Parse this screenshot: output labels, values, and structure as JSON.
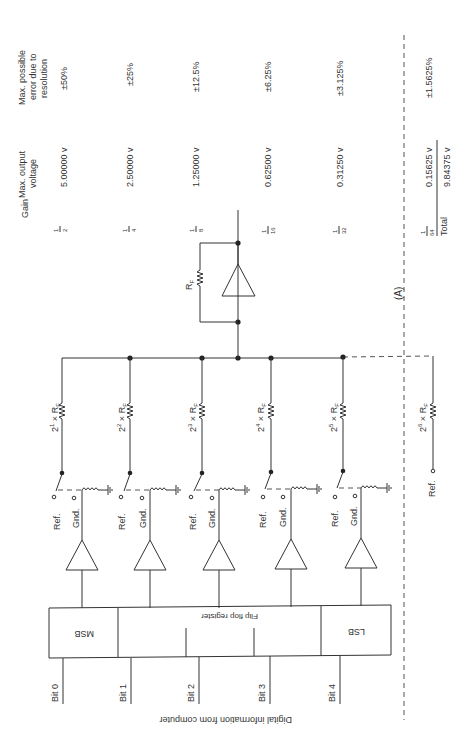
{
  "figure": {
    "label": "(A)",
    "caption_input": "Digital information from computer",
    "register": {
      "title": "Flip flop register",
      "msb": "MSB",
      "lsb": "LSB"
    },
    "bits": [
      "Bit 0",
      "Bit 1",
      "Bit 2",
      "Bit 3",
      "Bit 4"
    ],
    "switch_labels": {
      "ref": "Ref.",
      "gnd": "Gnd."
    },
    "resistors": [
      "2¹ × Rₙ",
      "2² × R",
      "2³ × R",
      "2⁴ × R",
      "2⁵ × R",
      "2⁶ × R"
    ],
    "resistor_base": [
      "2",
      "2",
      "2",
      "2",
      "2",
      "2"
    ],
    "resistor_exp": [
      "1",
      "2",
      "3",
      "4",
      "5",
      "6"
    ],
    "resistor_suffix": "× R",
    "resistor_sub": "F",
    "feedback_resistor": "R",
    "feedback_sub": "F",
    "extra_ref": "Ref."
  },
  "table": {
    "headers": {
      "gain": "Gain",
      "voltage_l1": "Max. output",
      "voltage_l2": "voltage",
      "error_l1": "Max. possible",
      "error_l2": "error due to",
      "error_l3": "resolution"
    },
    "rows": [
      {
        "gain_num": "1",
        "gain_den": "2",
        "voltage": "5.00000 v",
        "error": "±50%"
      },
      {
        "gain_num": "1",
        "gain_den": "4",
        "voltage": "2.50000 v",
        "error": "±25%"
      },
      {
        "gain_num": "1",
        "gain_den": "8",
        "voltage": "1.25000 v",
        "error": "±12.5%"
      },
      {
        "gain_num": "1",
        "gain_den": "16",
        "voltage": "0.62500 v",
        "error": "±6.25%"
      },
      {
        "gain_num": "1",
        "gain_den": "32",
        "voltage": "0.31250 v",
        "error": "±3.125%"
      },
      {
        "gain_num": "1",
        "gain_den": "64",
        "voltage": "0.15625 v",
        "error": "±1.5625%"
      }
    ],
    "total_label": "Total",
    "total_voltage": "9.84375 v"
  }
}
